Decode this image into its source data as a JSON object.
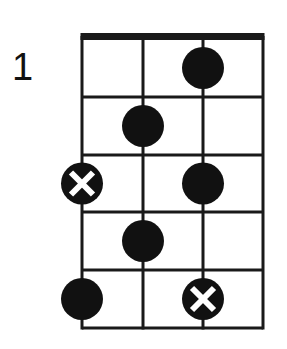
{
  "diagram": {
    "starting_fret": "1",
    "strings": 4,
    "frets": 5,
    "colors": {
      "line": "#1a1a1a",
      "dot": "#111111",
      "background": "#ffffff"
    },
    "notes": [
      {
        "string": 3,
        "fret": 1,
        "type": "dot"
      },
      {
        "string": 2,
        "fret": 2,
        "type": "dot"
      },
      {
        "string": 1,
        "fret": 3,
        "type": "root-x"
      },
      {
        "string": 3,
        "fret": 3,
        "type": "dot"
      },
      {
        "string": 2,
        "fret": 4,
        "type": "dot"
      },
      {
        "string": 1,
        "fret": 5,
        "type": "dot"
      },
      {
        "string": 3,
        "fret": 5,
        "type": "root-x"
      }
    ]
  }
}
